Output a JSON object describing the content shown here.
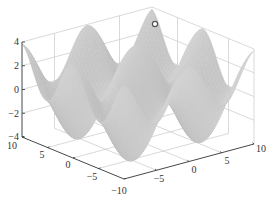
{
  "chart_data": {
    "type": "surface3d",
    "title": "",
    "xlabel": "",
    "ylabel": "",
    "zlabel": "",
    "xlim": [
      -10,
      10
    ],
    "ylim": [
      -10,
      10
    ],
    "zlim": [
      -4,
      4
    ],
    "x_ticks": [
      "10",
      "5",
      "0",
      "−5",
      "−10"
    ],
    "y_ticks": [
      "−5",
      "0",
      "5",
      "10"
    ],
    "z_ticks": [
      "4",
      "2",
      "0",
      "−2",
      "−4"
    ],
    "grid": true,
    "surface": {
      "description": "Egg-crate style periodic surface with ~3-4 peaks per direction, values ranging roughly from -4 to 4",
      "function_approx": "z = 2*cos(0.6*x) + 2*cos(0.6*y)",
      "color": "#b8b8b8"
    },
    "annotations": [
      {
        "type": "marker",
        "shape": "circle",
        "x": 10,
        "y": 0,
        "z": 4,
        "label": ""
      }
    ]
  },
  "colors": {
    "axis": "#333333",
    "grid": "#c8c8c8",
    "surface": "#bdbdbd",
    "surface_edge": "#a8a8a8",
    "marker": "#555555"
  }
}
